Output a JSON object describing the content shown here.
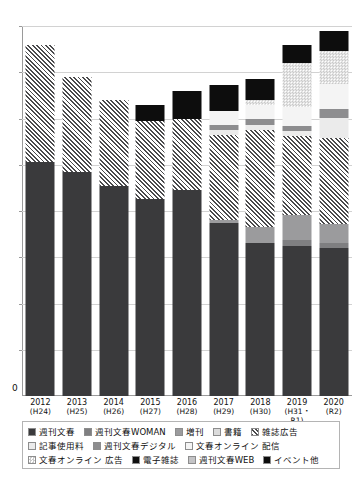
{
  "chart_data": {
    "type": "bar",
    "title": "",
    "xlabel": "",
    "ylabel": "",
    "stacked": true,
    "grid": true,
    "legend_position": "bottom",
    "ylim": [
      0,
      8
    ],
    "y_tick_labels": [
      "0"
    ],
    "gridline_count": 8,
    "categories": [
      "2012",
      "2013",
      "2014",
      "2015",
      "2016",
      "2017",
      "2018",
      "2019",
      "2020"
    ],
    "category_sublabels": [
      "(H24)",
      "(H25)",
      "(H26)",
      "(H27)",
      "(H28)",
      "(H29)",
      "(H30)",
      "(H31・R1)",
      "(R2)"
    ],
    "series": [
      {
        "name": "週刊文春",
        "key": "shunju",
        "fill": "solid-dark",
        "color": "#3a3a3c",
        "values": [
          5.05,
          4.85,
          4.55,
          4.25,
          4.45,
          3.75,
          3.3,
          3.25,
          3.2
        ]
      },
      {
        "name": "週刊文春WOMAN",
        "key": "woman",
        "fill": "solid-gray",
        "color": "#7f7f81",
        "values": [
          0,
          0,
          0,
          0,
          0,
          0,
          0,
          0.12,
          0.1
        ]
      },
      {
        "name": "増刊",
        "key": "zokan",
        "fill": "solid-midgray",
        "color": "#9b9b9d",
        "values": [
          0,
          0,
          0,
          0,
          0,
          0.05,
          0.35,
          0.55,
          0.42
        ]
      },
      {
        "name": "書籍",
        "key": "shoseki",
        "fill": "light-gray",
        "color": "#dcdcdc",
        "values": [
          0,
          0,
          0,
          0,
          0,
          0,
          0,
          0,
          0
        ]
      },
      {
        "name": "雑誌広告",
        "key": "zasshiad",
        "fill": "diagonal-hatch",
        "color": "#4a4a4c",
        "values": [
          2.55,
          2.05,
          1.85,
          1.7,
          1.55,
          1.85,
          2.1,
          1.7,
          1.85
        ]
      },
      {
        "name": "記事使用料",
        "key": "kijishiyo",
        "fill": "pale-gray",
        "color": "#ebebeb",
        "values": [
          0,
          0,
          0,
          0,
          0,
          0.1,
          0.1,
          0.1,
          0.45
        ]
      },
      {
        "name": "週刊文春デジタル",
        "key": "digital",
        "fill": "solid-gray",
        "color": "#8d8d8f",
        "values": [
          0,
          0,
          0,
          0,
          0,
          0.12,
          0.15,
          0.12,
          0.18
        ]
      },
      {
        "name": "文春オンライン 配信",
        "key": "haishin",
        "fill": "near-white",
        "color": "#f4f4f4",
        "values": [
          0,
          0,
          0,
          0,
          0,
          0.3,
          0.3,
          0.4,
          0.55
        ]
      },
      {
        "name": "文春オンライン 広告",
        "key": "onlinead",
        "fill": "checker",
        "color": "#c9c9c9",
        "values": [
          0,
          0,
          0,
          0,
          0,
          0,
          0.1,
          0.95,
          0.7
        ]
      },
      {
        "name": "電子雑誌",
        "key": "denshi",
        "fill": "solid-black",
        "color": "#101010",
        "values": [
          0,
          0,
          0,
          0,
          0,
          0,
          0,
          0,
          0
        ]
      },
      {
        "name": "週刊文春WEB",
        "key": "web",
        "fill": "light-gray",
        "color": "#c4c4c6",
        "values": [
          0,
          0,
          0,
          0,
          0,
          0,
          0,
          0,
          0
        ]
      },
      {
        "name": "イベント他",
        "key": "event",
        "fill": "solid-black",
        "color": "#0d0d0d",
        "values": [
          0,
          0,
          0,
          0.35,
          0.6,
          0.55,
          0.45,
          0.4,
          0.45
        ]
      }
    ]
  },
  "axis": {
    "zero_label": "0"
  },
  "legend": {
    "rows": [
      [
        {
          "label": "週刊文春",
          "key": "shunju"
        },
        {
          "label": "週刊文春WOMAN",
          "key": "woman"
        },
        {
          "label": "増刊",
          "key": "zokan"
        },
        {
          "label": "書籍",
          "key": "shoseki"
        },
        {
          "label": "雑誌広告",
          "key": "zasshiad"
        }
      ],
      [
        {
          "label": "記事使用料",
          "key": "kijishiyo"
        },
        {
          "label": "週刊文春デジタル",
          "key": "digital"
        },
        {
          "label": "文春オンライン 配信",
          "key": "haishin"
        }
      ],
      [
        {
          "label": "文春オンライン 広告",
          "key": "onlinead"
        },
        {
          "label": "電子雑誌",
          "key": "denshi"
        },
        {
          "label": "週刊文春WEB",
          "key": "web"
        },
        {
          "label": "イベント他",
          "key": "event"
        }
      ]
    ]
  }
}
